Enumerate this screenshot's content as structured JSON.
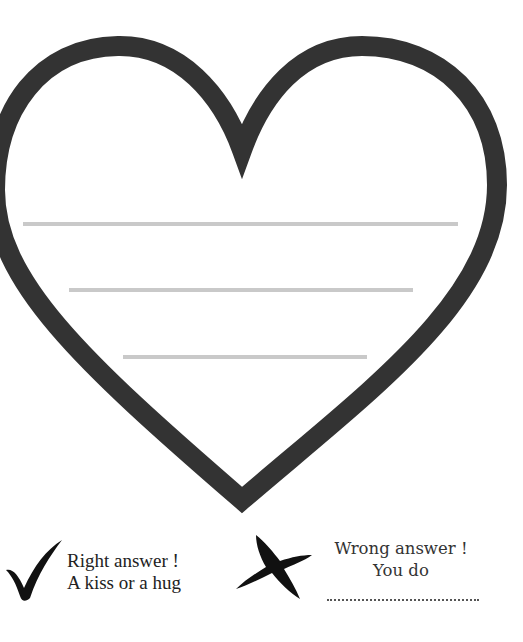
{
  "worksheet": {
    "heart": {
      "outline_color": "#333333",
      "writing_lines": [
        {
          "y": 223,
          "x1": 23,
          "x2": 458
        },
        {
          "y": 289,
          "x1": 69,
          "x2": 413
        },
        {
          "y": 356,
          "x1": 123,
          "x2": 367
        }
      ],
      "line_color": "#c9c9c9"
    },
    "legend": {
      "right": {
        "icon": "checkmark-icon",
        "line1": "Right answer !",
        "line2": "A kiss or a hug"
      },
      "wrong": {
        "icon": "cross-icon",
        "line1": "Wrong answer !",
        "line2": "You do",
        "blank": ""
      }
    }
  }
}
